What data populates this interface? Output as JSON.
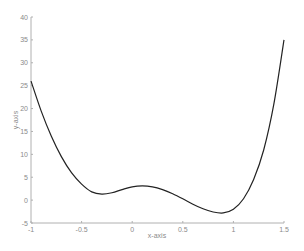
{
  "chart_data": {
    "type": "line",
    "title": "",
    "xlabel": "x-axis",
    "ylabel": "y-axis",
    "xlim": [
      -1,
      1.5
    ],
    "ylim": [
      -5,
      40
    ],
    "grid": false,
    "legend": null,
    "xticks": [
      -1,
      -0.5,
      0,
      0.5,
      1,
      1.5
    ],
    "xtick_labels": [
      "-1",
      "-0.5",
      "0",
      "0.5",
      "1",
      "1.5"
    ],
    "yticks": [
      -5,
      0,
      5,
      10,
      15,
      20,
      25,
      30,
      35,
      40
    ],
    "ytick_labels": [
      "-5",
      "0",
      "5",
      "10",
      "15",
      "20",
      "25",
      "30",
      "35",
      "40"
    ],
    "series": [
      {
        "name": "curve",
        "color": "#222222",
        "x": [
          -1,
          -0.9,
          -0.8,
          -0.7,
          -0.6,
          -0.5,
          -0.4,
          -0.3,
          -0.2,
          -0.1,
          0,
          0.1,
          0.2,
          0.3,
          0.4,
          0.5,
          0.6,
          0.7,
          0.8,
          0.9,
          1.0,
          1.1,
          1.2,
          1.3,
          1.4,
          1.5
        ],
        "y": [
          26,
          19.5,
          14,
          9.5,
          6,
          3.5,
          1.8,
          1.3,
          1.6,
          2.3,
          2.9,
          3.1,
          2.9,
          2.3,
          1.4,
          0.3,
          -0.9,
          -1.9,
          -2.6,
          -2.8,
          -2.0,
          0.3,
          4.5,
          11,
          21,
          35
        ]
      }
    ]
  },
  "colors": {
    "axis": "#b0b0b0",
    "line": "#222222",
    "background": "#ffffff"
  }
}
